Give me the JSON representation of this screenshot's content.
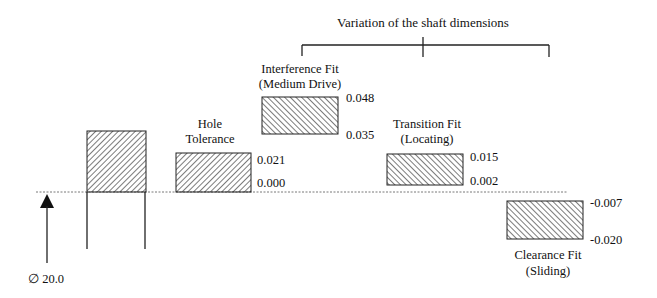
{
  "title": "Variation of the shaft dimensions",
  "nominal_diameter": "∅ 20.0",
  "hole_tolerance": {
    "label_line1": "Hole",
    "label_line2": "Tolerance",
    "upper": "0.021",
    "lower": "0.000"
  },
  "interference_fit": {
    "label_line1": "Interference Fit",
    "label_line2": "(Medium Drive)",
    "upper": "0.048",
    "lower": "0.035"
  },
  "transition_fit": {
    "label_line1": "Transition Fit",
    "label_line2": "(Locating)",
    "upper": "0.015",
    "lower": "0.002"
  },
  "clearance_fit": {
    "label_line1": "Clearance Fit",
    "label_line2": "(Sliding)",
    "upper": "-0.007",
    "lower": "-0.020"
  },
  "icons": {
    "arrow": "arrow-up-icon",
    "diameter": "diameter-symbol"
  }
}
